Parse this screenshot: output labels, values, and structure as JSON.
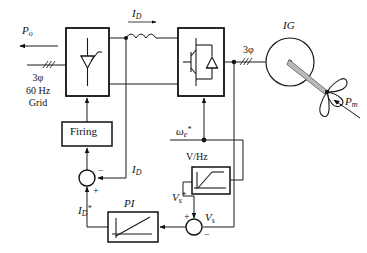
{
  "diagram": {
    "type": "electrical-schematic"
  },
  "labels": {
    "p_out": "P",
    "p_out_sub": "o",
    "grid_line1": "3φ",
    "grid_line2": "60 Hz",
    "grid_line3": "Grid",
    "i_d": "I",
    "i_d_sub": "D",
    "i_d_feedback": "I",
    "i_d_feedback_sub": "D",
    "i_d_ref": "I",
    "i_d_ref_sub": "D",
    "i_d_ref_sup": "*",
    "three_phase_machine": "3φ",
    "machine": "IG",
    "p_mech": "P",
    "p_mech_sub": "m",
    "firing": "Firing",
    "pi": "PI",
    "v_hz": "V/Hz",
    "omega_ref": "ω",
    "omega_ref_sub": "e",
    "omega_ref_sup": "*",
    "v_s_ref": "V",
    "v_s_ref_sub": "s",
    "v_s_ref_sup": "*",
    "v_s": "V",
    "v_s_sub": "s",
    "plus": "+",
    "minus": "−"
  },
  "colors": {
    "background": "#ffffff",
    "wire": "#1a1a1a",
    "block_border": "#111111",
    "shaft": "#b9b9b9",
    "text": "#111111"
  },
  "blocks": [
    {
      "name": "rectifier",
      "device": "thyristor",
      "label": ""
    },
    {
      "name": "inverter",
      "device": "igbt-with-diode",
      "label": ""
    },
    {
      "name": "firing-block",
      "label": "Firing"
    },
    {
      "name": "pi-controller",
      "label": "PI"
    },
    {
      "name": "v-per-hz-block",
      "label": "V/Hz"
    }
  ]
}
